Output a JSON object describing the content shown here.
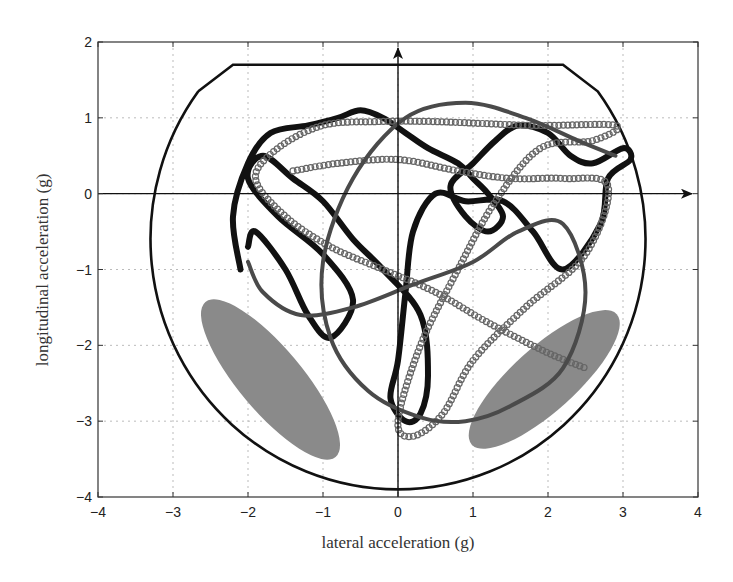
{
  "chart_data": {
    "type": "scatter",
    "title": "",
    "xlabel": "lateral acceleration (g)",
    "ylabel": "longitudinal acceleration (g)",
    "xlim": [
      -4,
      4
    ],
    "ylim": [
      -4,
      2
    ],
    "xticks": [
      -4,
      -3,
      -2,
      -1,
      0,
      1,
      2,
      3,
      4
    ],
    "yticks": [
      -4,
      -3,
      -2,
      -1,
      0,
      1,
      2
    ],
    "grid": true,
    "legend": null,
    "annotations": {
      "axis_arrows": "arrows along x=0 (up) and y=0 (right)",
      "boundary": {
        "description": "friction circle boundary truncated at top",
        "center": [
          0,
          -0.6
        ],
        "radius": 3.3,
        "flat_top_y": 1.7,
        "flat_top_x_range": [
          -2.2,
          2.2
        ]
      },
      "shaded_ellipses": [
        {
          "center": [
            -1.7,
            -2.45
          ],
          "semi_axes": [
            1.35,
            0.42
          ],
          "angle_deg": -50,
          "color": "#8a8a8a"
        },
        {
          "center": [
            1.95,
            -2.45
          ],
          "semi_axes": [
            1.3,
            0.42
          ],
          "angle_deg": 42,
          "color": "#8a8a8a"
        }
      ]
    },
    "series": [
      {
        "name": "trajectory-solid",
        "style": "thick black line",
        "color": "#111111",
        "points": [
          [
            -2.1,
            -1.0
          ],
          [
            -2.2,
            -0.3
          ],
          [
            -2.0,
            0.4
          ],
          [
            -1.7,
            0.8
          ],
          [
            -1.2,
            0.9
          ],
          [
            -0.8,
            1.0
          ],
          [
            -0.5,
            1.1
          ],
          [
            -0.2,
            1.0
          ],
          [
            0.1,
            0.8
          ],
          [
            0.4,
            0.6
          ],
          [
            0.8,
            0.4
          ],
          [
            1.0,
            0.2
          ],
          [
            1.2,
            0.0
          ],
          [
            1.4,
            -0.3
          ],
          [
            1.2,
            -0.5
          ],
          [
            0.9,
            -0.3
          ],
          [
            0.7,
            0.1
          ],
          [
            1.0,
            0.4
          ],
          [
            1.3,
            0.7
          ],
          [
            1.6,
            0.9
          ],
          [
            2.0,
            0.8
          ],
          [
            2.3,
            0.5
          ],
          [
            2.6,
            0.4
          ],
          [
            3.0,
            0.6
          ],
          [
            3.1,
            0.45
          ],
          [
            2.8,
            0.2
          ],
          [
            2.7,
            -0.4
          ],
          [
            2.2,
            -1.0
          ],
          [
            1.8,
            -0.5
          ],
          [
            1.4,
            -0.1
          ],
          [
            0.9,
            -0.1
          ],
          [
            0.5,
            0.0
          ],
          [
            0.2,
            -0.5
          ],
          [
            0.1,
            -1.3
          ],
          [
            0.0,
            -2.2
          ],
          [
            -0.1,
            -2.7
          ],
          [
            0.1,
            -3.0
          ],
          [
            0.3,
            -2.9
          ],
          [
            0.4,
            -2.4
          ],
          [
            0.3,
            -1.6
          ],
          [
            -0.2,
            -1.0
          ],
          [
            -0.6,
            -0.6
          ],
          [
            -1.0,
            -0.1
          ],
          [
            -1.4,
            0.2
          ],
          [
            -1.8,
            0.5
          ],
          [
            -2.0,
            0.2
          ],
          [
            -1.6,
            -0.3
          ],
          [
            -1.0,
            -0.8
          ],
          [
            -0.6,
            -1.4
          ],
          [
            -0.9,
            -1.9
          ],
          [
            -1.2,
            -1.6
          ],
          [
            -1.5,
            -1.0
          ],
          [
            -1.9,
            -0.5
          ],
          [
            -2.0,
            -0.7
          ]
        ]
      },
      {
        "name": "trajectory-circles",
        "style": "gray hollow circle markers",
        "color": "#666666",
        "points": [
          [
            -1.4,
            0.3
          ],
          [
            -0.8,
            0.4
          ],
          [
            0.0,
            0.45
          ],
          [
            0.8,
            0.3
          ],
          [
            1.5,
            0.2
          ],
          [
            2.2,
            0.2
          ],
          [
            2.8,
            0.1
          ],
          [
            2.5,
            -0.8
          ],
          [
            1.7,
            -1.5
          ],
          [
            1.0,
            -2.2
          ],
          [
            0.6,
            -2.9
          ],
          [
            0.2,
            -3.2
          ],
          [
            0.0,
            -3.0
          ],
          [
            0.3,
            -2.0
          ],
          [
            0.8,
            -1.0
          ],
          [
            1.3,
            -0.1
          ],
          [
            1.9,
            0.6
          ],
          [
            2.6,
            0.7
          ],
          [
            2.9,
            0.9
          ],
          [
            1.8,
            0.9
          ],
          [
            0.5,
            0.95
          ],
          [
            -0.3,
            0.95
          ],
          [
            -1.0,
            0.9
          ],
          [
            -1.6,
            0.6
          ],
          [
            -1.9,
            0.2
          ],
          [
            -1.5,
            -0.3
          ],
          [
            -0.9,
            -0.7
          ],
          [
            -0.2,
            -1.0
          ],
          [
            0.5,
            -1.3
          ],
          [
            1.2,
            -1.7
          ],
          [
            2.0,
            -2.1
          ],
          [
            2.5,
            -2.3
          ]
        ]
      },
      {
        "name": "trajectory-gray-line",
        "style": "medium gray line",
        "color": "#4a4a4a",
        "points": [
          [
            -2.0,
            -0.9
          ],
          [
            -1.8,
            -1.3
          ],
          [
            -1.3,
            -1.6
          ],
          [
            -0.6,
            -1.5
          ],
          [
            0.2,
            -1.2
          ],
          [
            1.0,
            -0.9
          ],
          [
            1.6,
            -0.5
          ],
          [
            2.2,
            -0.4
          ],
          [
            2.5,
            -1.3
          ],
          [
            2.2,
            -2.3
          ],
          [
            1.5,
            -2.8
          ],
          [
            0.9,
            -3.0
          ],
          [
            0.3,
            -2.95
          ],
          [
            -0.4,
            -2.6
          ],
          [
            -0.9,
            -1.9
          ],
          [
            -1.0,
            -0.9
          ],
          [
            -0.6,
            0.2
          ],
          [
            0.1,
            1.0
          ],
          [
            0.9,
            1.2
          ],
          [
            1.7,
            1.0
          ],
          [
            2.4,
            0.7
          ],
          [
            2.9,
            0.5
          ]
        ]
      }
    ]
  }
}
